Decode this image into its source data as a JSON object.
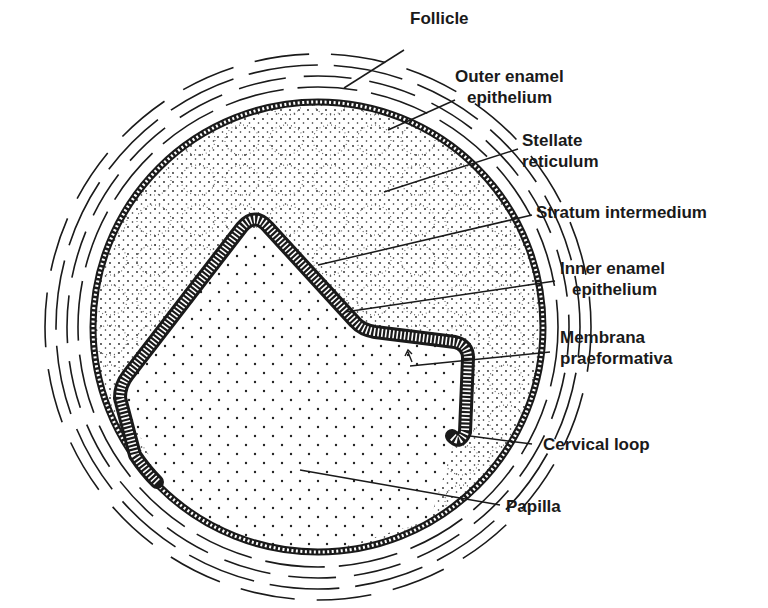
{
  "diagram": {
    "labels": [
      {
        "id": "follicle",
        "lines": [
          "Follicle"
        ],
        "x": 410,
        "y": 8
      },
      {
        "id": "outer-enamel-epithelium",
        "lines": [
          "Outer enamel",
          "epithelium"
        ],
        "x": 455,
        "y": 68
      },
      {
        "id": "stellate-reticulum",
        "lines": [
          "Stellate",
          "reticulum"
        ],
        "x": 522,
        "y": 130
      },
      {
        "id": "stratum-intermedium",
        "lines": [
          "Stratum intermedium"
        ],
        "x": 536,
        "y": 202
      },
      {
        "id": "inner-enamel-epithelium",
        "lines": [
          "Inner enamel",
          "epithelium"
        ],
        "x": 560,
        "y": 258
      },
      {
        "id": "membrana-praeformativa",
        "lines": [
          "Membrana",
          "praeformativa"
        ],
        "x": 560,
        "y": 327
      },
      {
        "id": "cervical-loop",
        "lines": [
          "Cervical loop"
        ],
        "x": 543,
        "y": 430
      },
      {
        "id": "papilla",
        "lines": [
          "Papilla"
        ],
        "x": 506,
        "y": 494
      }
    ],
    "colors": {
      "ink": "#1a1a1a",
      "background": "#ffffff"
    }
  }
}
